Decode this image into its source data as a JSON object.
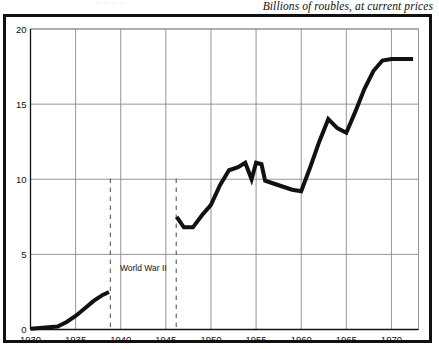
{
  "caption": {
    "units": "Billions of roubles, at current prices",
    "clipped_artifact": "~ ~ ~ ~"
  },
  "chart_data": {
    "type": "line",
    "title": "",
    "subtitle": "Billions of roubles, at current prices",
    "xlabel": "",
    "ylabel": "",
    "xlim": [
      1930,
      1973
    ],
    "ylim": [
      0,
      20
    ],
    "xticks": [
      1930,
      1935,
      1940,
      1945,
      1950,
      1955,
      1960,
      1965,
      1970
    ],
    "xtick_labels": [
      "1930",
      "1935",
      "1940",
      "1945",
      "1950",
      "1955",
      "1960",
      "1965",
      "1970"
    ],
    "yticks": [
      0,
      5,
      10,
      15,
      20
    ],
    "ytick_labels": [
      "0",
      "5",
      "10",
      "15",
      "20"
    ],
    "grid": true,
    "legend": null,
    "line_color": "#111111",
    "line_width": 4,
    "series": [
      {
        "name": "Soviet defence expenditure",
        "x": [
          1930,
          1931,
          1932,
          1933,
          1934,
          1935,
          1936,
          1937,
          1938,
          1938.7
        ],
        "values": [
          0.05,
          0.1,
          0.15,
          0.2,
          0.5,
          0.9,
          1.4,
          1.9,
          2.3,
          2.5
        ]
      },
      {
        "name": "Soviet defence expenditure (post-war)",
        "x": [
          1946.2,
          1947,
          1948,
          1949,
          1950,
          1951,
          1952,
          1953,
          1953.8,
          1954.5,
          1955,
          1955.6,
          1956,
          1957,
          1958,
          1959,
          1960,
          1961,
          1962,
          1963,
          1964,
          1965,
          1966,
          1967,
          1968,
          1969,
          1970,
          1972.4
        ],
        "values": [
          7.5,
          6.8,
          6.8,
          7.6,
          8.3,
          9.6,
          10.6,
          10.8,
          11.1,
          10.0,
          11.1,
          11.0,
          9.9,
          9.7,
          9.5,
          9.3,
          9.2,
          10.8,
          12.5,
          14.0,
          13.4,
          13.1,
          14.5,
          16.0,
          17.2,
          17.9,
          18.0,
          18.0
        ]
      }
    ],
    "annotations": [
      {
        "label": "World War II",
        "type": "span",
        "start_x": 1938.85,
        "end_x": 1946.15,
        "line_style": "dashed",
        "label_x": 1942.5,
        "label_y": 3.9
      }
    ]
  }
}
